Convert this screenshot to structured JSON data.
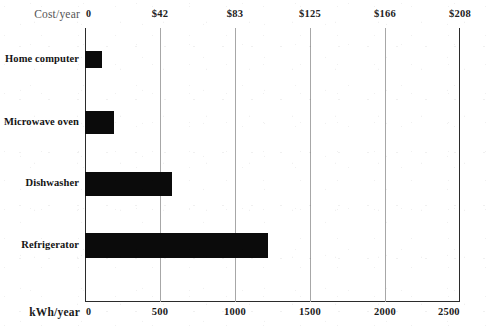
{
  "chart_data": {
    "type": "bar",
    "orientation": "horizontal",
    "title": "",
    "subtitle": "",
    "categories": [
      "Home computer",
      "Microwave oven",
      "Dishwasher",
      "Refrigerator"
    ],
    "values": [
      110,
      190,
      580,
      1220
    ],
    "series": [
      {
        "name": "Annual energy use",
        "values": [
          110,
          190,
          580,
          1220
        ]
      }
    ],
    "xlabel": "kWh/year",
    "ylabel": "",
    "secondary_xlabel": "Cost/year",
    "xlim": [
      0,
      2500
    ],
    "secondary_xlim": [
      0,
      208
    ],
    "xticks": [
      0,
      500,
      1000,
      1500,
      2000,
      2500
    ],
    "xticklabels": [
      "0",
      "500",
      "1000",
      "1500",
      "2000",
      "2500"
    ],
    "secondary_xticks": [
      0,
      42,
      83,
      125,
      166,
      208
    ],
    "secondary_xticklabels": [
      "0",
      "$42",
      "$83",
      "$125",
      "$166",
      "$208"
    ],
    "grid": true,
    "grid_axis": "x",
    "legend": false,
    "legend_position": "none",
    "bar_color": "#0b0b0b",
    "grid_color": "#a7a7a7",
    "axis_color": "#2b2b2b",
    "background": "#ffffff"
  },
  "axes": {
    "top": {
      "label": "Cost/year",
      "ticks": [
        {
          "label": "0",
          "value": 0,
          "pos_pct": 0
        },
        {
          "label": "$42",
          "value": 42,
          "pos_pct": 20
        },
        {
          "label": "$83",
          "value": 83,
          "pos_pct": 40
        },
        {
          "label": "$125",
          "value": 125,
          "pos_pct": 60
        },
        {
          "label": "$166",
          "value": 166,
          "pos_pct": 80
        },
        {
          "label": "$208",
          "value": 208,
          "pos_pct": 100
        }
      ]
    },
    "bottom": {
      "label": "kWh/year",
      "ticks": [
        {
          "label": "0",
          "value": 0,
          "pos_pct": 0
        },
        {
          "label": "500",
          "value": 500,
          "pos_pct": 20
        },
        {
          "label": "1000",
          "value": 1000,
          "pos_pct": 40
        },
        {
          "label": "1500",
          "value": 1500,
          "pos_pct": 60
        },
        {
          "label": "2000",
          "value": 2000,
          "pos_pct": 80
        },
        {
          "label": "2500",
          "value": 2500,
          "pos_pct": 100
        }
      ]
    }
  },
  "bars": [
    {
      "label": "Home computer",
      "value": 110,
      "pct": 4.4,
      "top": 51,
      "height": 17
    },
    {
      "label": "Microwave oven",
      "value": 190,
      "pct": 7.6,
      "top": 111,
      "height": 23
    },
    {
      "label": "Dishwasher",
      "value": 580,
      "pct": 23.2,
      "top": 172,
      "height": 24
    },
    {
      "label": "Refrigerator",
      "value": 1220,
      "pct": 48.8,
      "top": 233,
      "height": 25
    }
  ]
}
